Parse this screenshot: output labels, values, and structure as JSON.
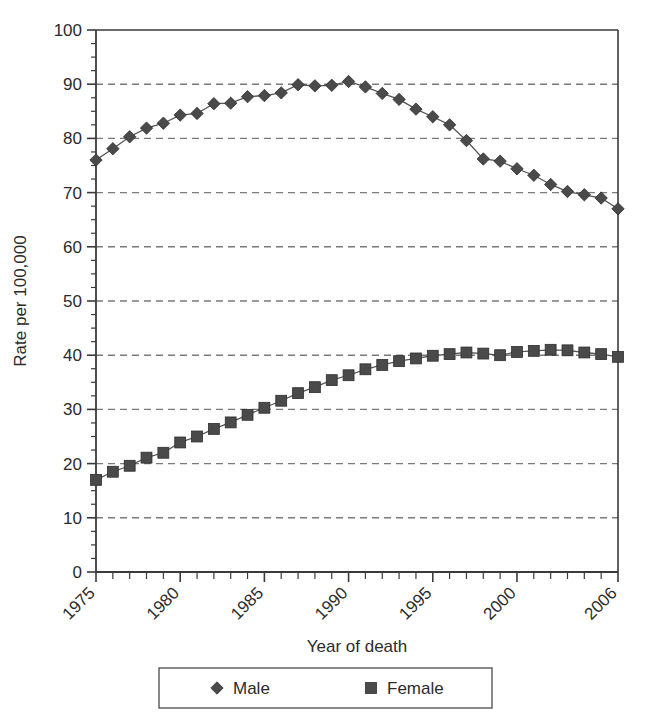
{
  "chart_data": {
    "type": "line",
    "title": "",
    "xlabel": "Year of death",
    "ylabel": "Rate per 100,000",
    "xlim": [
      1975,
      2006
    ],
    "ylim": [
      0,
      100
    ],
    "ytick_step": 10,
    "yminor_step": 2.5,
    "grid": "horizontal-dashed",
    "legend_position": "below-axis",
    "x": [
      1975,
      1976,
      1977,
      1978,
      1979,
      1980,
      1981,
      1982,
      1983,
      1984,
      1985,
      1986,
      1987,
      1988,
      1989,
      1990,
      1991,
      1992,
      1993,
      1994,
      1995,
      1996,
      1997,
      1998,
      1999,
      2000,
      2001,
      2002,
      2003,
      2004,
      2005,
      2006
    ],
    "xtick_labels": [
      "1975",
      "1980",
      "1985",
      "1990",
      "1995",
      "2000",
      "2006"
    ],
    "xtick_values": [
      1975,
      1980,
      1985,
      1990,
      1995,
      2000,
      2006
    ],
    "ytick_labels": [
      "0",
      "10",
      "20",
      "30",
      "40",
      "50",
      "60",
      "70",
      "80",
      "90",
      "100"
    ],
    "ytick_values": [
      0,
      10,
      20,
      30,
      40,
      50,
      60,
      70,
      80,
      90,
      100
    ],
    "series": [
      {
        "name": "Male",
        "marker": "diamond",
        "color": "#4a4a4a",
        "values": [
          76.0,
          78.1,
          80.3,
          81.9,
          82.8,
          84.3,
          84.6,
          86.4,
          86.5,
          87.7,
          87.9,
          88.4,
          89.9,
          89.7,
          89.8,
          90.5,
          89.5,
          88.3,
          87.2,
          85.4,
          84.0,
          82.5,
          79.6,
          76.2,
          75.8,
          74.4,
          73.2,
          71.5,
          70.2,
          69.6,
          69.0,
          67.0
        ]
      },
      {
        "name": "Female",
        "marker": "square",
        "color": "#4a4a4a",
        "values": [
          17.0,
          18.5,
          19.6,
          21.1,
          22.0,
          23.9,
          25.0,
          26.4,
          27.6,
          29.0,
          30.3,
          31.6,
          33.0,
          34.1,
          35.4,
          36.3,
          37.4,
          38.2,
          38.9,
          39.4,
          39.9,
          40.2,
          40.5,
          40.3,
          40.0,
          40.6,
          40.8,
          41.0,
          40.9,
          40.5,
          40.2,
          39.7
        ]
      }
    ]
  },
  "legend": {
    "items": [
      {
        "label": "Male",
        "marker": "diamond"
      },
      {
        "label": "Female",
        "marker": "square"
      }
    ]
  },
  "colors": {
    "axis": "#3a3a3a",
    "grid": "#7a7a7a",
    "series": "#4a4a4a",
    "text": "#2b2b2b",
    "background": "#ffffff"
  }
}
